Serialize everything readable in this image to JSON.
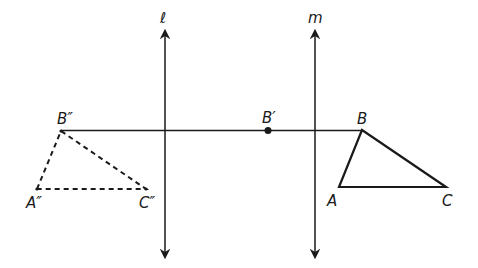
{
  "diagram": {
    "type": "reflection-composition",
    "lines": [
      {
        "id": "l",
        "label": "ℓ",
        "x": 165,
        "y1": 30,
        "y2": 257
      },
      {
        "id": "m",
        "label": "m",
        "x": 315,
        "y1": 30,
        "y2": 257
      }
    ],
    "original_triangle": {
      "style": "solid",
      "vertices": [
        {
          "name": "A",
          "label": "A",
          "x": 339,
          "y": 188
        },
        {
          "name": "B",
          "label": "B",
          "x": 362,
          "y": 130
        },
        {
          "name": "C",
          "label": "C",
          "x": 446,
          "y": 187
        }
      ]
    },
    "image_triangle": {
      "style": "dashed",
      "vertices": [
        {
          "name": "A''",
          "label": "A″",
          "x": 37,
          "y": 189
        },
        {
          "name": "B''",
          "label": "B″",
          "x": 61,
          "y": 131
        },
        {
          "name": "C''",
          "label": "C″",
          "x": 146,
          "y": 189
        }
      ]
    },
    "intermediate_point": {
      "name": "B'",
      "label": "B′",
      "x": 268,
      "y": 130
    },
    "connector": {
      "from": "B''",
      "to": "B",
      "y": 130
    },
    "colors": {
      "stroke": "#1a1a1a",
      "background": "#ffffff"
    }
  }
}
